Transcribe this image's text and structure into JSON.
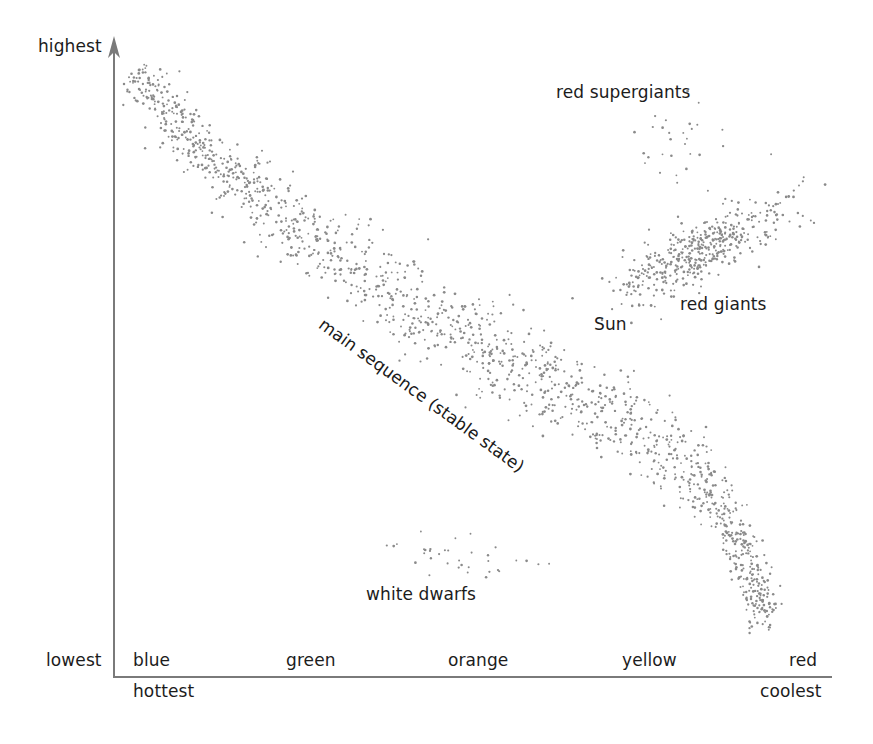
{
  "diagram": {
    "title": "",
    "y_axis": {
      "label": "absolute magnitude (true brightness)",
      "top_label": "highest",
      "bottom_label": "lowest"
    },
    "x_axis": {
      "color_labels": [
        "blue",
        "green",
        "orange",
        "yellow",
        "red"
      ],
      "left_label": "hottest",
      "right_label": "coolest"
    },
    "regions": {
      "main_sequence": "main sequence (stable state)",
      "red_supergiants": "red supergiants",
      "red_giants": "red giants",
      "sun": "Sun",
      "white_dwarfs": "white dwarfs"
    },
    "colors": {
      "axis": "#7a7a7a",
      "star": "#8a8a8a",
      "text": "#1c1c1c"
    }
  },
  "chart_data": {
    "type": "scatter",
    "title": "",
    "xlabel": "surface temperature / color (hottest → coolest)",
    "ylabel": "absolute magnitude (true brightness)",
    "x_ticks": [
      "blue",
      "green",
      "orange",
      "yellow",
      "red"
    ],
    "y_ticks": [
      "lowest",
      "highest"
    ],
    "grid": false,
    "legend": null,
    "series": [
      {
        "name": "main sequence",
        "description": "dense diagonal band from upper-left (blue, highest) curving to lower-right (red, lowest)",
        "path_px": [
          [
            135,
            70
          ],
          [
            200,
            150
          ],
          [
            320,
            245
          ],
          [
            450,
            330
          ],
          [
            560,
            390
          ],
          [
            640,
            430
          ],
          [
            700,
            480
          ],
          [
            740,
            540
          ],
          [
            770,
            630
          ]
        ],
        "count": 1500,
        "width_px": 42
      },
      {
        "name": "red giants",
        "description": "elongated cluster upper right",
        "center_px": [
          700,
          250
        ],
        "count": 450,
        "spread_px": [
          90,
          30
        ],
        "angle_deg": -28
      },
      {
        "name": "red supergiants",
        "description": "sparse cluster at top right",
        "center_px": [
          685,
          140
        ],
        "count": 30,
        "spread_px": [
          45,
          35
        ],
        "angle_deg": 0
      },
      {
        "name": "white dwarfs",
        "description": "sparse group in lower middle",
        "center_px": [
          440,
          555
        ],
        "count": 35,
        "spread_px": [
          95,
          25
        ],
        "angle_deg": 10
      }
    ],
    "annotations": [
      "red supergiants",
      "red giants",
      "Sun",
      "main sequence (stable state)",
      "white dwarfs"
    ]
  }
}
